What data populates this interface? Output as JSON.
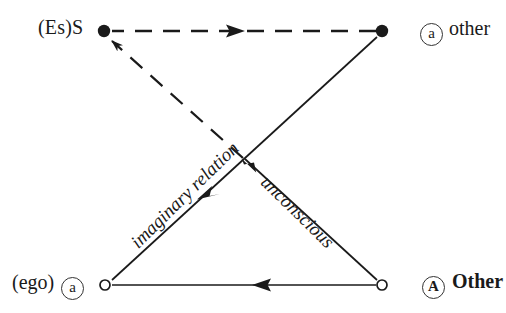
{
  "diagram": {
    "type": "directed-graph",
    "width": 506,
    "height": 313,
    "background": "#ffffff",
    "line_color": "#1a1a1a",
    "text_color": "#1a1a1a"
  },
  "nodes": [
    {
      "id": "S",
      "position": "top-left",
      "x": 104,
      "y": 31,
      "marker": "filled-dot",
      "marker_radius": 6,
      "label_text": "(Es)S",
      "label_side": "left",
      "token": null
    },
    {
      "id": "a-other",
      "position": "top-right",
      "x": 382,
      "y": 31,
      "marker": "filled-dot",
      "marker_radius": 6,
      "label_text": "other",
      "label_side": "right",
      "token": "a",
      "token_style": "circled"
    },
    {
      "id": "ego-a",
      "position": "bottom-left",
      "x": 104,
      "y": 285,
      "marker": "hollow-circle",
      "marker_radius": 5,
      "label_text": "(ego)",
      "label_side": "left",
      "token": "a",
      "token_style": "circled"
    },
    {
      "id": "A-Other",
      "position": "bottom-right",
      "x": 382,
      "y": 285,
      "marker": "hollow-circle",
      "marker_radius": 5,
      "label_text": "Other",
      "label_side": "right",
      "token": "A",
      "token_style": "circled-bold"
    }
  ],
  "edges": [
    {
      "id": "top-dashed",
      "from": "a-other",
      "to": "S",
      "style": "dashed",
      "direction": "right-to-left",
      "arrowhead": "mid-right-pointing",
      "label": ""
    },
    {
      "id": "diag-dashed",
      "from": "crossing",
      "to": "S",
      "style": "dashed",
      "direction": "down-right-to-up-left",
      "arrowhead": "at-target",
      "label": ""
    },
    {
      "id": "imaginary",
      "from": "ego-a",
      "to": "a-other",
      "style": "solid",
      "direction": "toward-ego",
      "arrowhead": "mid-down-left-pointing",
      "label": "imaginary relation"
    },
    {
      "id": "unconscious",
      "from": "A-Other",
      "to": "S",
      "style": "solid",
      "direction": "toward-upper-left",
      "arrowhead": "at-crossing-up-pointing",
      "label": "unconscious"
    },
    {
      "id": "bottom-solid",
      "from": "A-Other",
      "to": "ego-a",
      "style": "solid",
      "direction": "right-to-left",
      "arrowhead": "mid-left-pointing",
      "label": ""
    }
  ],
  "labels": {
    "top_left": "(Es)S",
    "top_right_token": "a",
    "top_right_word": "other",
    "bottom_left_word": "(ego)",
    "bottom_left_token": "a",
    "bottom_right_token": "A",
    "bottom_right_word": "Other",
    "imaginary_relation": "imaginary relation",
    "unconscious": "unconscious"
  }
}
